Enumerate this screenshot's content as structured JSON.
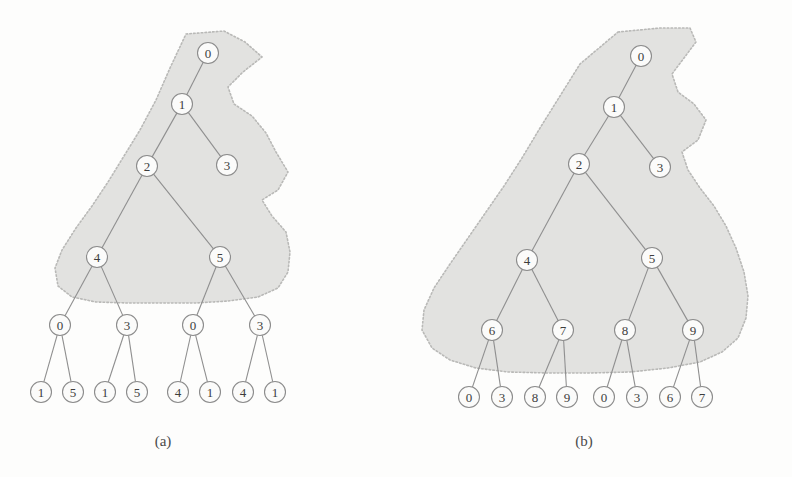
{
  "figure": {
    "background_color": "#fdfdfc",
    "blob_fill_color": "#e2e2e0",
    "blob_border_color": "#b9b9b7",
    "node_fill_color": "#fbfbfa",
    "node_stroke_color": "#8c8c8c",
    "edge_color": "#8f8f8f",
    "text_color": "#3d3d3d"
  },
  "panels": [
    {
      "id": "a",
      "caption": "(a)",
      "caption_x": 163,
      "caption_y": 446,
      "node_radius": 10.5,
      "nodes": [
        {
          "id": "a0",
          "label": "0",
          "x": 208,
          "y": 53,
          "level": 0,
          "in_region": true
        },
        {
          "id": "a1",
          "label": "1",
          "x": 182,
          "y": 104,
          "level": 1,
          "in_region": true
        },
        {
          "id": "a2",
          "label": "2",
          "x": 147,
          "y": 166,
          "level": 2,
          "in_region": true
        },
        {
          "id": "a3",
          "label": "3",
          "x": 227,
          "y": 165,
          "level": 2,
          "in_region": true
        },
        {
          "id": "a4",
          "label": "4",
          "x": 97,
          "y": 257,
          "level": 3,
          "in_region": true
        },
        {
          "id": "a5",
          "label": "5",
          "x": 220,
          "y": 257,
          "level": 3,
          "in_region": true
        },
        {
          "id": "a6",
          "label": "0",
          "x": 60,
          "y": 325,
          "level": 4,
          "in_region": false
        },
        {
          "id": "a7",
          "label": "3",
          "x": 127,
          "y": 325,
          "level": 4,
          "in_region": false
        },
        {
          "id": "a8",
          "label": "0",
          "x": 193,
          "y": 325,
          "level": 4,
          "in_region": false
        },
        {
          "id": "a9",
          "label": "3",
          "x": 260,
          "y": 325,
          "level": 4,
          "in_region": false
        },
        {
          "id": "a10",
          "label": "1",
          "x": 41,
          "y": 392,
          "level": 5,
          "in_region": false
        },
        {
          "id": "a11",
          "label": "5",
          "x": 73,
          "y": 392,
          "level": 5,
          "in_region": false
        },
        {
          "id": "a12",
          "label": "1",
          "x": 105,
          "y": 392,
          "level": 5,
          "in_region": false
        },
        {
          "id": "a13",
          "label": "5",
          "x": 137,
          "y": 392,
          "level": 5,
          "in_region": false
        },
        {
          "id": "a14",
          "label": "4",
          "x": 178,
          "y": 392,
          "level": 5,
          "in_region": false
        },
        {
          "id": "a15",
          "label": "1",
          "x": 210,
          "y": 392,
          "level": 5,
          "in_region": false
        },
        {
          "id": "a16",
          "label": "4",
          "x": 243,
          "y": 392,
          "level": 5,
          "in_region": false
        },
        {
          "id": "a17",
          "label": "1",
          "x": 275,
          "y": 392,
          "level": 5,
          "in_region": false
        }
      ],
      "edges": [
        [
          "a0",
          "a1"
        ],
        [
          "a1",
          "a2"
        ],
        [
          "a1",
          "a3"
        ],
        [
          "a2",
          "a4"
        ],
        [
          "a2",
          "a5"
        ],
        [
          "a4",
          "a6"
        ],
        [
          "a4",
          "a7"
        ],
        [
          "a5",
          "a8"
        ],
        [
          "a5",
          "a9"
        ],
        [
          "a6",
          "a10"
        ],
        [
          "a6",
          "a11"
        ],
        [
          "a7",
          "a12"
        ],
        [
          "a7",
          "a13"
        ],
        [
          "a8",
          "a14"
        ],
        [
          "a8",
          "a15"
        ],
        [
          "a9",
          "a16"
        ],
        [
          "a9",
          "a17"
        ]
      ],
      "region_path": "M 186,34 L 224,31 L 245,42 L 262,57 L 243,72 L 228,87 L 234,104 L 252,116 L 266,133 L 276,152 L 288,172 L 278,190 L 262,200 L 272,216 L 286,232 L 290,252 L 288,272 L 278,288 L 258,297 L 228,301 L 196,303 L 160,303 L 128,303 L 96,302 L 72,297 L 58,286 L 55,268 L 62,250 L 76,228 L 92,206 L 108,182 L 124,156 L 140,130 L 156,100 L 170,68 Z"
    },
    {
      "id": "b",
      "caption": "(b)",
      "caption_x": 584,
      "caption_y": 446,
      "node_radius": 10.5,
      "nodes": [
        {
          "id": "b0",
          "label": "0",
          "x": 641,
          "y": 56,
          "level": 0,
          "in_region": true
        },
        {
          "id": "b1",
          "label": "1",
          "x": 614,
          "y": 107,
          "level": 1,
          "in_region": true
        },
        {
          "id": "b2",
          "label": "2",
          "x": 579,
          "y": 164,
          "level": 2,
          "in_region": true
        },
        {
          "id": "b3",
          "label": "3",
          "x": 660,
          "y": 167,
          "level": 2,
          "in_region": true
        },
        {
          "id": "b4",
          "label": "4",
          "x": 527,
          "y": 260,
          "level": 3,
          "in_region": true
        },
        {
          "id": "b5",
          "label": "5",
          "x": 652,
          "y": 258,
          "level": 3,
          "in_region": true
        },
        {
          "id": "b6",
          "label": "6",
          "x": 492,
          "y": 330,
          "level": 4,
          "in_region": true
        },
        {
          "id": "b7",
          "label": "7",
          "x": 563,
          "y": 330,
          "level": 4,
          "in_region": true
        },
        {
          "id": "b8",
          "label": "8",
          "x": 625,
          "y": 330,
          "level": 4,
          "in_region": true
        },
        {
          "id": "b9",
          "label": "9",
          "x": 693,
          "y": 330,
          "level": 4,
          "in_region": true
        },
        {
          "id": "b10",
          "label": "0",
          "x": 469,
          "y": 397,
          "level": 5,
          "in_region": false
        },
        {
          "id": "b11",
          "label": "3",
          "x": 502,
          "y": 397,
          "level": 5,
          "in_region": false
        },
        {
          "id": "b12",
          "label": "8",
          "x": 535,
          "y": 397,
          "level": 5,
          "in_region": false
        },
        {
          "id": "b13",
          "label": "9",
          "x": 567,
          "y": 397,
          "level": 5,
          "in_region": false
        },
        {
          "id": "b14",
          "label": "0",
          "x": 604,
          "y": 397,
          "level": 5,
          "in_region": false
        },
        {
          "id": "b15",
          "label": "3",
          "x": 637,
          "y": 397,
          "level": 5,
          "in_region": false
        },
        {
          "id": "b16",
          "label": "6",
          "x": 670,
          "y": 397,
          "level": 5,
          "in_region": false
        },
        {
          "id": "b17",
          "label": "7",
          "x": 702,
          "y": 397,
          "level": 5,
          "in_region": false
        }
      ],
      "edges": [
        [
          "b0",
          "b1"
        ],
        [
          "b1",
          "b2"
        ],
        [
          "b1",
          "b3"
        ],
        [
          "b2",
          "b4"
        ],
        [
          "b2",
          "b5"
        ],
        [
          "b4",
          "b6"
        ],
        [
          "b4",
          "b7"
        ],
        [
          "b5",
          "b8"
        ],
        [
          "b5",
          "b9"
        ],
        [
          "b6",
          "b10"
        ],
        [
          "b6",
          "b11"
        ],
        [
          "b7",
          "b12"
        ],
        [
          "b7",
          "b13"
        ],
        [
          "b8",
          "b14"
        ],
        [
          "b8",
          "b15"
        ],
        [
          "b9",
          "b16"
        ],
        [
          "b9",
          "b17"
        ]
      ],
      "region_path": "M 618,32 L 660,28 L 690,28 L 696,42 L 684,58 L 672,74 L 678,92 L 694,104 L 706,120 L 698,140 L 682,152 L 688,170 L 700,188 L 714,206 L 726,226 L 736,248 L 744,272 L 748,296 L 746,318 L 738,338 L 722,352 L 700,362 L 668,368 L 630,372 L 590,373 L 548,373 L 508,372 L 476,368 L 450,360 L 432,348 L 422,330 L 424,310 L 434,288 L 450,264 L 468,238 L 486,212 L 504,186 L 522,158 L 540,128 L 560,96 L 580,64 Z"
    }
  ]
}
